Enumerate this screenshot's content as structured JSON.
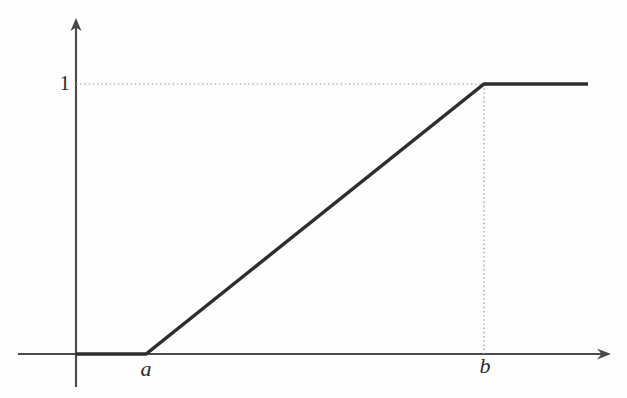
{
  "figure": {
    "title": "",
    "background_color": "#fefefe",
    "axis_color": "#4a4a4a",
    "curve_color": "#2e2e2e",
    "guide_color": "#9a9a9a",
    "label_color": "#2b2b2b"
  },
  "axes": {
    "y_axis": {
      "name": "y-axis",
      "x": 76,
      "top": 19,
      "bottom": 387,
      "arrow": "up-arrow"
    },
    "x_axis": {
      "name": "x-axis",
      "y": 354,
      "left": 18,
      "right": 610,
      "arrow": "right-arrow"
    }
  },
  "labels": {
    "y_tick_1": "1",
    "x_tick_a": "a",
    "x_tick_b": "b"
  },
  "guides": [
    {
      "name": "horizontal-guide-at-one",
      "orientation": "horizontal",
      "y": 84,
      "from_x": 76,
      "to_x": 484,
      "style": "dotted"
    },
    {
      "name": "vertical-guide-at-b",
      "orientation": "vertical",
      "x": 484,
      "from_y": 84,
      "to_y": 354,
      "style": "dotted"
    }
  ],
  "chart_data": {
    "type": "line",
    "title": "",
    "xlabel": "",
    "ylabel": "",
    "x": [
      "",
      "a",
      "b",
      ""
    ],
    "values": [
      0,
      0,
      1,
      1
    ],
    "series": [
      {
        "name": "ramp",
        "points": [
          {
            "x_label": "",
            "x_px": 76,
            "y_value": 0
          },
          {
            "x_label": "a",
            "x_px": 146,
            "y_value": 0
          },
          {
            "x_label": "b",
            "x_px": 484,
            "y_value": 1
          },
          {
            "x_label": "",
            "x_px": 588,
            "y_value": 1
          }
        ]
      }
    ],
    "xticks": [
      "a",
      "b"
    ],
    "xtick_positions_px": [
      146,
      484
    ],
    "yticks": [
      "1"
    ],
    "ytick_positions_px": [
      84
    ],
    "ylim": [
      0,
      1.25
    ],
    "grid": false,
    "legend": null
  }
}
